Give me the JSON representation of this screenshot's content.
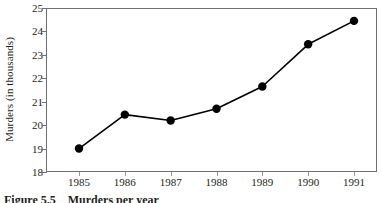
{
  "chart_data": {
    "type": "line",
    "title": "",
    "xlabel": "",
    "ylabel": "Murders (in thousands)",
    "categories": [
      "1985",
      "1986",
      "1987",
      "1988",
      "1989",
      "1990",
      "1991"
    ],
    "x": [
      1985,
      1986,
      1987,
      1988,
      1989,
      1990,
      1991
    ],
    "values": [
      19.0,
      20.45,
      20.2,
      20.7,
      21.65,
      23.45,
      24.45
    ],
    "series": [
      {
        "name": "Murders",
        "values": [
          19.0,
          20.45,
          20.2,
          20.7,
          21.65,
          23.45,
          24.45
        ]
      }
    ],
    "ylim": [
      18,
      25
    ],
    "yticks": [
      18,
      19,
      20,
      21,
      22,
      23,
      24,
      25
    ],
    "ytick_labels": [
      "18",
      "19",
      "20",
      "21",
      "22",
      "23",
      "24",
      "25"
    ],
    "xtick_labels": [
      "1985",
      "1986",
      "1987",
      "1988",
      "1989",
      "1990",
      "1991"
    ],
    "grid": false,
    "legend": false,
    "legend_position": "none",
    "marker": "filled-circle",
    "line_color": "#000000",
    "marker_color": "#000000",
    "axis_color": "#6f6f6f",
    "background_color": "#ffffff"
  },
  "caption": {
    "label": "Figure 5.5",
    "text": "Murders per year"
  }
}
